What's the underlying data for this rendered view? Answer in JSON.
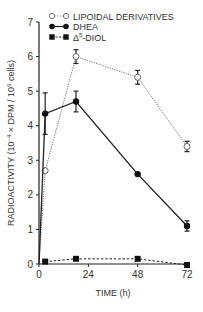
{
  "chart_data": {
    "type": "line",
    "title": "",
    "xlabel": "TIME (h)",
    "ylabel": "RADIOACTIVITY (10⁻⁴ × DPM / 10⁶ cells)",
    "ylabel_parts": {
      "main": "RADIOACTIVITY (10",
      "exp1": "−4",
      "mid": " × DPM / 10",
      "exp2": "6",
      "end": " cells)"
    },
    "xlim": [
      0,
      72
    ],
    "ylim": [
      0,
      7
    ],
    "x_ticks": [
      0,
      24,
      48,
      72
    ],
    "y_ticks": [
      0,
      1,
      2,
      3,
      4,
      5,
      6,
      7
    ],
    "grid": false,
    "legend_position": "top",
    "series": [
      {
        "name": "LIPOIDAL DERIVATIVES",
        "marker": "open-circle",
        "line": "dotted",
        "color": "#777777",
        "x": [
          0,
          3,
          18,
          48,
          72
        ],
        "values": [
          0,
          2.7,
          6.0,
          5.4,
          3.4
        ],
        "errors": [
          0,
          0,
          0.2,
          0.2,
          0.15
        ]
      },
      {
        "name": "DHEA",
        "marker": "filled-circle",
        "line": "solid",
        "color": "#222222",
        "x": [
          0,
          3,
          18,
          48,
          72
        ],
        "values": [
          0,
          4.35,
          4.7,
          2.6,
          1.1
        ],
        "errors": [
          0,
          0.6,
          0.3,
          0,
          0.15
        ]
      },
      {
        "name": "Δ⁵-DIOL",
        "marker": "filled-square",
        "line": "dashed",
        "color": "#222222",
        "x": [
          3,
          18,
          48,
          72
        ],
        "values": [
          0.07,
          0.15,
          0.15,
          -0.03
        ],
        "errors": [
          0,
          0,
          0,
          0
        ]
      }
    ]
  },
  "legend": {
    "items": [
      {
        "label": "LIPOIDAL DERIVATIVES"
      },
      {
        "label": "DHEA"
      },
      {
        "label_prefix": "Δ",
        "label_sup": "5",
        "label_suffix": "-DIOL"
      }
    ]
  },
  "axes": {
    "x_tick_labels": [
      "0",
      "24",
      "48",
      "72"
    ],
    "y_tick_labels": [
      "0",
      "1",
      "2",
      "3",
      "4",
      "5",
      "6",
      "7"
    ]
  }
}
